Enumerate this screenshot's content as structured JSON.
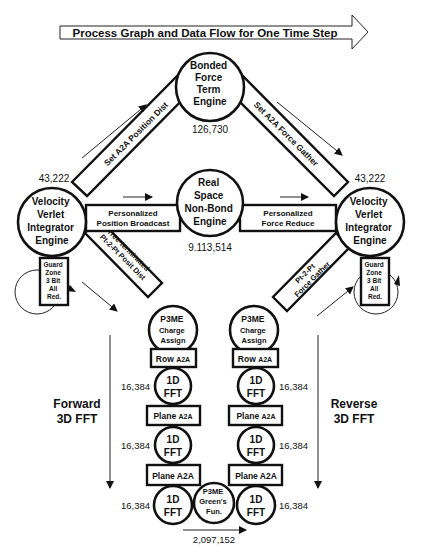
{
  "title": "Process Graph and Data Flow for One Time Step",
  "nodes": {
    "bonded": {
      "lines": [
        "Bonded",
        "Force",
        "Term",
        "Engine"
      ],
      "count": "126,730"
    },
    "vv_left": {
      "lines": [
        "Velocity",
        "Verlet",
        "Integrator",
        "Engine"
      ],
      "count": "43,222"
    },
    "vv_right": {
      "lines": [
        "Velocity",
        "Verlet",
        "Integrator",
        "Engine"
      ],
      "count": "43,222"
    },
    "realspace": {
      "lines": [
        "Real",
        "Space",
        "Non-Bond",
        "Engine"
      ],
      "count": "9.113,514"
    },
    "p3me_charge_left": {
      "lines": [
        "P3ME",
        "Charge",
        "Assign"
      ]
    },
    "p3me_charge_right": {
      "lines": [
        "P3ME",
        "Charge",
        "Assign"
      ]
    },
    "p3me_greens": {
      "lines": [
        "P3ME",
        "Green's",
        "Fun."
      ],
      "count": "2,097,152"
    },
    "fft_label": [
      "1D",
      "FFT"
    ]
  },
  "edges": {
    "set_a2a_position_dist": "Set A2A Position Dist",
    "set_a2a_force_gather": "Set A2A Force Gather",
    "personalized_position_broadcast": [
      "Personalized",
      "Position Broadcast"
    ],
    "personalized_force_reduce": [
      "Personalized",
      "Force Reduce"
    ],
    "tree_terminated": [
      "Tree-terminated",
      "Pt-2-Pt Posit Dist"
    ],
    "pt2pt_force_gather": [
      "Pt-2-Pt",
      "Force Gather"
    ],
    "guard_zone": [
      "Guard",
      "Zone",
      "3 Bit",
      "All",
      "Red."
    ]
  },
  "fft_columns": {
    "left": {
      "boxes": [
        {
          "main": "Row",
          "sub": "A2A"
        },
        {
          "main": "Plane",
          "sub": "A2A"
        },
        {
          "main": "Plane A2A",
          "sub": ""
        }
      ],
      "counts": [
        "16,384",
        "16,384",
        "16,384"
      ]
    },
    "right": {
      "boxes": [
        {
          "main": "Row",
          "sub": "A2A"
        },
        {
          "main": "Plane",
          "sub": "A2A"
        },
        {
          "main": "Plane A2A",
          "sub": ""
        }
      ],
      "counts": [
        "16,384",
        "16,384",
        "16,384"
      ]
    }
  },
  "side_labels": {
    "forward": [
      "Forward",
      "3D FFT"
    ],
    "reverse": [
      "Reverse",
      "3D FFT"
    ]
  }
}
